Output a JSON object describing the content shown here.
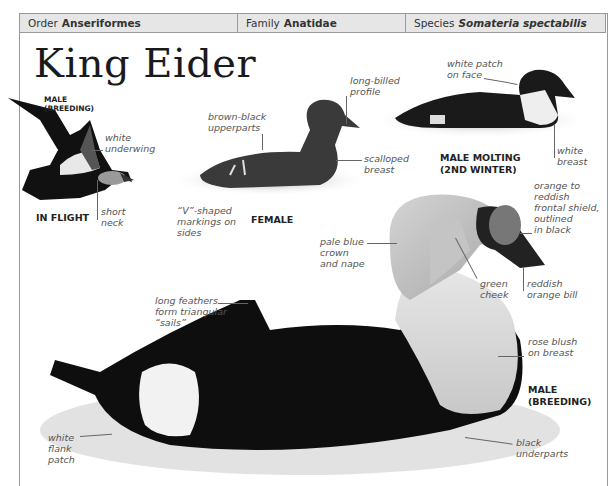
{
  "header": {
    "order_label": "Order",
    "order_value": "Anseriformes",
    "family_label": "Family",
    "family_value": "Anatidae",
    "species_label": "Species",
    "species_value": "Somateria spectabilis"
  },
  "title": "King Eider",
  "figures": {
    "flight": {
      "caption_top_1": "MALE",
      "caption_top_2": "(BREEDING)",
      "caption": "IN FLIGHT",
      "labels": {
        "underwing_1": "white",
        "underwing_2": "underwing",
        "neck_1": "short",
        "neck_2": "neck"
      }
    },
    "female": {
      "caption": "FEMALE",
      "labels": {
        "upperparts_1": "brown-black",
        "upperparts_2": "upperparts",
        "profile_1": "long-billed",
        "profile_2": "profile",
        "breast_1": "scalloped",
        "breast_2": "breast",
        "v_1": "“V”-shaped",
        "v_2": "markings on",
        "v_3": "sides"
      }
    },
    "molting": {
      "caption_1": "MALE MOLTING",
      "caption_2": "(2ND WINTER)",
      "labels": {
        "face_1": "white patch",
        "face_2": "on face",
        "breast_1": "white",
        "breast_2": "breast"
      }
    },
    "male_breeding": {
      "caption_1": "MALE",
      "caption_2": "(BREEDING)",
      "labels": {
        "shield_1": "orange to",
        "shield_2": "reddish",
        "shield_3": "frontal shield,",
        "shield_4": "outlined",
        "shield_5": "in black",
        "crown_1": "pale blue",
        "crown_2": "crown",
        "crown_3": "and nape",
        "cheek_1": "green",
        "cheek_2": "cheek",
        "bill_1": "reddish",
        "bill_2": "orange bill",
        "sails_1": "long feathers",
        "sails_2": "form triangular",
        "sails_3": "“sails”",
        "blush_1": "rose blush",
        "blush_2": "on breast",
        "flank_1": "white",
        "flank_2": "flank",
        "flank_3": "patch",
        "under_1": "black",
        "under_2": "underparts"
      }
    }
  }
}
